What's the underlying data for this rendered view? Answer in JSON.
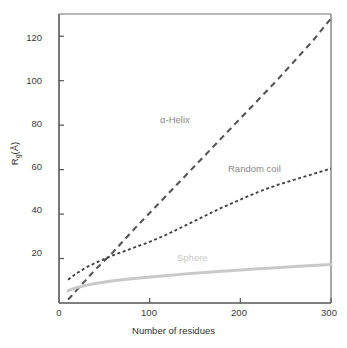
{
  "chart_data": {
    "type": "line",
    "title": "",
    "xlabel": "Number of residues",
    "ylabel": "Rg(Å)",
    "ylabel_base": "R",
    "ylabel_sub": "g",
    "ylabel_unit": "(Å)",
    "xlim": [
      0,
      300
    ],
    "ylim": [
      0,
      130
    ],
    "xticks": [
      0,
      100,
      200,
      300
    ],
    "yticks": [
      20,
      40,
      60,
      80,
      100,
      120
    ],
    "xtick_labels": [
      "0",
      "100",
      "200",
      "300"
    ],
    "ytick_labels": [
      "20",
      "40",
      "60",
      "80",
      "100",
      "120"
    ],
    "grid": false,
    "legend_position": "inline-annotations",
    "series": [
      {
        "name": "α-Helix",
        "label": "α-Helix",
        "style": "long-dashed",
        "color": "#555555",
        "x": [
          10,
          20,
          40,
          60,
          80,
          100,
          120,
          140,
          160,
          180,
          200,
          220,
          240,
          260,
          280,
          300
        ],
        "values": [
          1.5,
          6,
          15,
          23,
          32,
          40.5,
          49,
          57.5,
          66,
          74.5,
          83,
          91.5,
          100,
          109,
          118,
          128
        ]
      },
      {
        "name": "Random coil",
        "label": "Random coil",
        "style": "short-dashed",
        "color": "#444444",
        "x": [
          10,
          20,
          30,
          40,
          50,
          60,
          80,
          100,
          120,
          140,
          160,
          180,
          200,
          220,
          240,
          260,
          280,
          300
        ],
        "values": [
          10.5,
          13.5,
          16,
          18,
          19.8,
          21.5,
          24.5,
          27.5,
          31,
          35,
          39,
          43,
          46.5,
          50,
          53,
          55.5,
          58,
          60.5
        ]
      },
      {
        "name": "Sphere",
        "label": "Sphere",
        "style": "solid",
        "color": "#c9c9c9",
        "x": [
          10,
          20,
          30,
          40,
          60,
          80,
          100,
          120,
          140,
          160,
          180,
          200,
          220,
          240,
          260,
          280,
          300
        ],
        "values": [
          5.5,
          7,
          8,
          8.8,
          10,
          10.9,
          11.7,
          12.4,
          13.1,
          13.7,
          14.3,
          14.9,
          15.4,
          15.9,
          16.4,
          16.9,
          17.3
        ]
      }
    ],
    "axis_color": "#555555",
    "background": "#ffffff"
  }
}
